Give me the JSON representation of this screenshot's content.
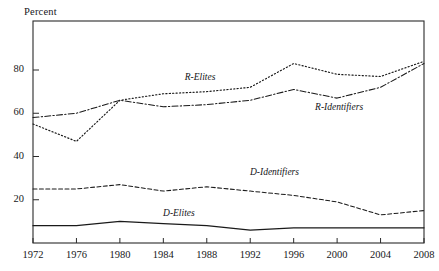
{
  "chart_data": {
    "type": "line",
    "title": "",
    "xlabel": "",
    "ylabel": "Percent",
    "xlim": [
      1972,
      2008
    ],
    "ylim": [
      0,
      90
    ],
    "yticks": [
      20,
      40,
      60,
      80
    ],
    "ytick_labels": [
      "20",
      "40",
      "60",
      "80"
    ],
    "x": [
      1972,
      1976,
      1980,
      1984,
      1988,
      1992,
      1996,
      2000,
      2004,
      2008
    ],
    "xtick_labels": [
      "1972",
      "1976",
      "1980",
      "1984",
      "1988",
      "1992",
      "1996",
      "2000",
      "2004",
      "2008"
    ],
    "grid": false,
    "legend": "inline-curve-labels",
    "series": [
      {
        "name": "R-Elites",
        "label": "R-Elites",
        "style": "dotted",
        "color": "#1a1a1a",
        "values": [
          55,
          47,
          66,
          69,
          70,
          72,
          83,
          78,
          77,
          84
        ],
        "label_x": 1988,
        "label_y": 76
      },
      {
        "name": "R-Identifiers",
        "label": "R-Identifiers",
        "style": "dash-dot",
        "color": "#1a1a1a",
        "values": [
          58,
          60,
          66,
          63,
          64,
          66,
          71,
          67,
          72,
          83
        ],
        "label_x": 2000,
        "label_y": 62
      },
      {
        "name": "D-Identifiers",
        "label": "D-Identifiers",
        "style": "dashed",
        "color": "#1a1a1a",
        "values": [
          25,
          25,
          27,
          24,
          26,
          24,
          22,
          19,
          13,
          15
        ],
        "label_x": 1994,
        "label_y": 32
      },
      {
        "name": "D-Elites",
        "label": "D-Elites",
        "style": "solid",
        "color": "#1a1a1a",
        "values": [
          8,
          8,
          10,
          9,
          8,
          6,
          7,
          7,
          7,
          7
        ],
        "label_x": 1986,
        "label_y": 13
      }
    ]
  },
  "axes": {
    "y_axis_title": "Percent"
  }
}
